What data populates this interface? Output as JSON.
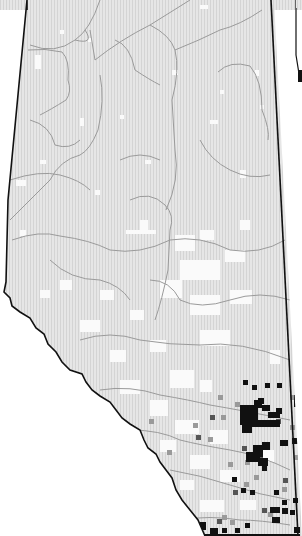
{
  "map": {
    "title": "",
    "region": "Alberta",
    "width": 302,
    "height": 536,
    "colors": {
      "background": "#ffffff",
      "land_fill": "#e4e4e4",
      "grid_hatch": "#d6d6d6",
      "absent_cell": "#fafafa",
      "river": "#9a9a9a",
      "border": "#111111",
      "occurrence_high": "#111111",
      "occurrence_mid": "#555555",
      "occurrence_low": "#9a9a9a"
    },
    "legend": [],
    "notes": "Grid-based occurrence distribution; dense dark cells in south-east (Calgary/Red Deer corridor); no visible text labels."
  }
}
